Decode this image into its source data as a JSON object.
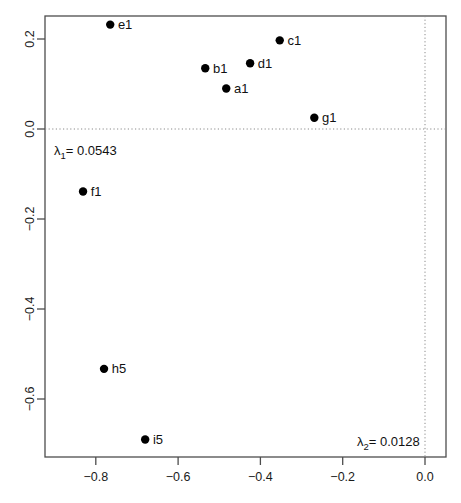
{
  "chart_data": {
    "type": "scatter",
    "title": "",
    "xlabel": "",
    "ylabel": "",
    "xlim": [
      -0.92,
      0.035
    ],
    "ylim": [
      -0.775,
      0.275
    ],
    "grid": false,
    "legend": "none",
    "xticks": [
      -0.8,
      -0.6,
      -0.4,
      -0.2,
      0.0
    ],
    "xticklabels": [
      "-0.8",
      "-0.6",
      "-0.4",
      "-0.2",
      "0.0"
    ],
    "yticks": [
      0.2,
      0.0,
      -0.2,
      -0.4,
      -0.6
    ],
    "yticklabels": [
      "0.2",
      "0.0",
      "-0.2",
      "-0.4",
      "-0.6"
    ],
    "reference_lines": [
      {
        "orientation": "horizontal",
        "value": 0.0,
        "style": "dotted"
      },
      {
        "orientation": "vertical",
        "value": 0.0,
        "style": "dotted"
      }
    ],
    "point_color": "#000000",
    "points": [
      {
        "label": "e1",
        "x": -0.765,
        "y": 0.232,
        "label_side": "right"
      },
      {
        "label": "c1",
        "x": -0.353,
        "y": 0.197,
        "label_side": "right"
      },
      {
        "label": "d1",
        "x": -0.425,
        "y": 0.146,
        "label_side": "right"
      },
      {
        "label": "b1",
        "x": -0.534,
        "y": 0.135,
        "label_side": "right"
      },
      {
        "label": "a1",
        "x": -0.483,
        "y": 0.09,
        "label_side": "right"
      },
      {
        "label": "g1",
        "x": -0.269,
        "y": 0.025,
        "label_side": "right"
      },
      {
        "label": "f1",
        "x": -0.831,
        "y": -0.139,
        "label_side": "right"
      },
      {
        "label": "h5",
        "x": -0.78,
        "y": -0.533,
        "label_side": "right"
      },
      {
        "label": "i5",
        "x": -0.68,
        "y": -0.69,
        "label_side": "right"
      }
    ],
    "annotations": [
      {
        "name": "lambda-1-annotation",
        "symbol": "λ",
        "subscript": "1",
        "text": "= 0.0543",
        "full_text": "λ₁= 0.0543"
      },
      {
        "name": "lambda-2-annotation",
        "symbol": "λ",
        "subscript": "2",
        "text": "= 0.0128",
        "full_text": "λ₂= 0.0128"
      }
    ]
  },
  "geometry": {
    "plot_left": 45,
    "plot_right": 446,
    "plot_top": 16,
    "plot_bottom": 457,
    "x_zero_px": 425,
    "y_zero_px": 129,
    "x_scale_px_per_unit": 411.5,
    "y_scale_px_per_unit": 450,
    "point_radius": 4.2
  }
}
